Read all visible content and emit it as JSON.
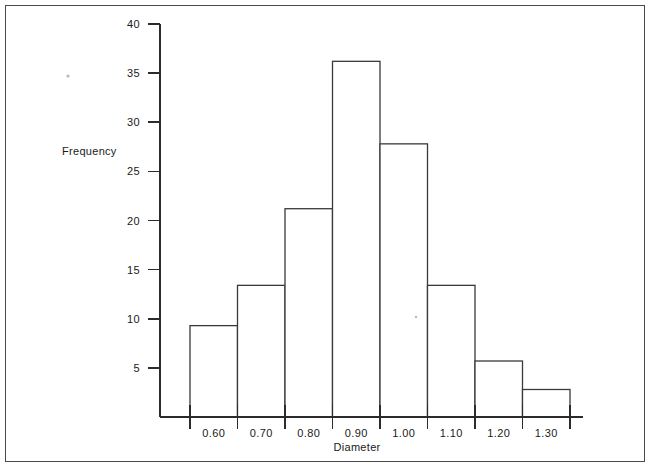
{
  "figure": {
    "background_color": "#ffffff",
    "frame_color": "#4a4a4a",
    "ink_color": "#2b2b2b"
  },
  "chart_data": {
    "type": "bar",
    "title": "",
    "xlabel": "Diameter",
    "ylabel": "Frequency",
    "categories": [
      "0.55-0.65",
      "0.65-0.75",
      "0.75-0.85",
      "0.85-0.95",
      "0.95-1.05",
      "1.05-1.15",
      "1.15-1.25",
      "1.25-1.35"
    ],
    "bin_edges": [
      0.55,
      0.65,
      0.75,
      0.85,
      0.95,
      1.05,
      1.15,
      1.25,
      1.35
    ],
    "bin_centers": [
      0.6,
      0.7,
      0.8,
      0.9,
      1.0,
      1.1,
      1.2,
      1.3
    ],
    "values": [
      9.3,
      13.4,
      21.2,
      36.2,
      27.8,
      13.4,
      5.7,
      2.8
    ],
    "xtick_labels": [
      "0.60",
      "0.70",
      "0.80",
      "0.90",
      "1.00",
      "1.10",
      "1.20",
      "1.30"
    ],
    "ytick_values": [
      5,
      10,
      15,
      20,
      25,
      30,
      35,
      40
    ],
    "ytick_labels": [
      "5",
      "10",
      "15",
      "20",
      "25",
      "30",
      "35",
      "40"
    ],
    "ylim": [
      0,
      40
    ],
    "xlim": [
      0.55,
      1.35
    ],
    "grid": false,
    "legend": null,
    "bar_style": "outline"
  }
}
